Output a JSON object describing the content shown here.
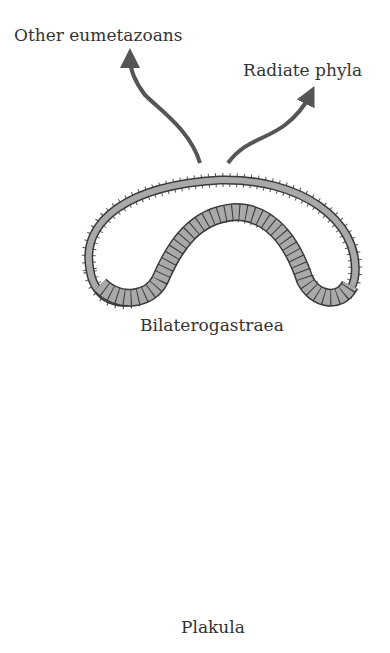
{
  "diagram": {
    "labels": {
      "other_eumetazoans": "Other eumetazoans",
      "radiate_phyla": "Radiate phyla",
      "bilaterogastraea": "Bilaterogastraea",
      "plakula": "Plakula"
    },
    "stages": [
      "Plakula",
      "Intermediate (folded plakula)",
      "Bilaterogastraea"
    ],
    "branches": [
      "Other eumetazoans",
      "Radiate phyla"
    ],
    "colors": {
      "cell_fill": "#a9a9a9",
      "outline": "#3a3a3a",
      "arrow": "#555555",
      "text": "#333333"
    }
  }
}
